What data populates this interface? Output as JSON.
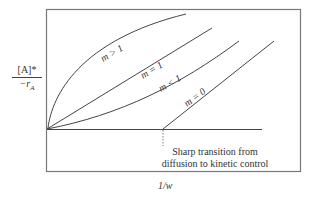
{
  "diagram": {
    "y_axis_label": {
      "numerator": "[A]*",
      "denominator": "−r_A",
      "denominator_main": "−r",
      "denominator_sub": "A"
    },
    "x_axis_label": "1/w",
    "curves": [
      {
        "id": "m_gt_1",
        "label": "m > 1",
        "shape": "concave-down"
      },
      {
        "id": "m_eq_1",
        "label": "m = 1",
        "shape": "linear"
      },
      {
        "id": "m_lt_1",
        "label": "m < 1",
        "shape": "concave-up"
      },
      {
        "id": "m_eq_0",
        "label": "m = 0",
        "shape": "zero then linear after breakpoint"
      }
    ],
    "annotation": {
      "line1": "Sharp transition from",
      "line2": "diffusion to kinetic control"
    },
    "colors": {
      "line": "#444444",
      "frame": "#777777"
    }
  }
}
